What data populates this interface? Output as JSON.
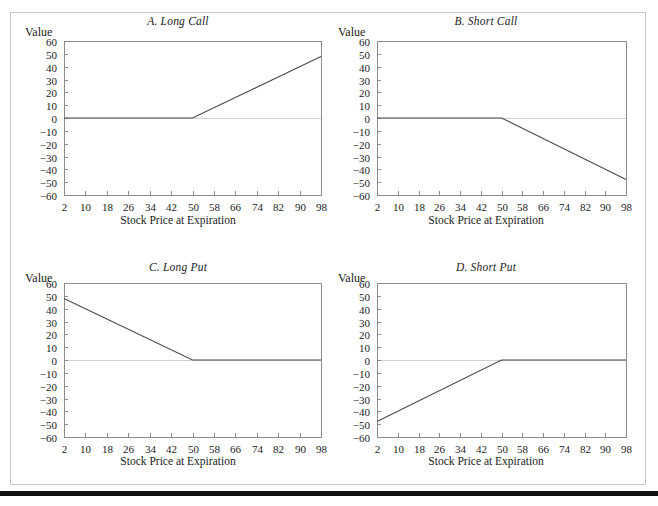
{
  "figure": {
    "value_axis_label": "Value",
    "x_axis_label": "Stock Price at Expiration",
    "frame_color": "#c8c8c8",
    "line_color": "#4a4a4a",
    "rule_color": "#111111"
  },
  "panels": [
    {
      "key": "a",
      "title": "A. Long Call"
    },
    {
      "key": "b",
      "title": "B. Short Call"
    },
    {
      "key": "c",
      "title": "C. Long Put"
    },
    {
      "key": "d",
      "title": "D. Short Put"
    }
  ],
  "chart_data": [
    {
      "type": "line",
      "title": "A. Long Call",
      "xlabel": "Stock Price at Expiration",
      "ylabel": "Value",
      "xlim": [
        2,
        98
      ],
      "ylim": [
        -60,
        60
      ],
      "xticks": [
        2,
        10,
        18,
        26,
        34,
        42,
        50,
        58,
        66,
        74,
        82,
        90,
        98
      ],
      "yticks": [
        60,
        50,
        40,
        30,
        20,
        10,
        0,
        -10,
        -20,
        -30,
        -40,
        -50,
        -60
      ],
      "grid": false,
      "legend": "none",
      "series": [
        {
          "name": "Long Call payoff",
          "x": [
            2,
            50,
            98
          ],
          "values": [
            0,
            0,
            48
          ]
        }
      ],
      "annotations": [
        "strike price = 50",
        "payoff = max(S - 50, 0)"
      ]
    },
    {
      "type": "line",
      "title": "B. Short Call",
      "xlabel": "Stock Price at Expiration",
      "ylabel": "Value",
      "xlim": [
        2,
        98
      ],
      "ylim": [
        -60,
        60
      ],
      "xticks": [
        2,
        10,
        18,
        26,
        34,
        42,
        50,
        58,
        66,
        74,
        82,
        90,
        98
      ],
      "yticks": [
        60,
        50,
        40,
        30,
        20,
        10,
        0,
        -10,
        -20,
        -30,
        -40,
        -50,
        -60
      ],
      "grid": false,
      "legend": "none",
      "series": [
        {
          "name": "Short Call payoff",
          "x": [
            2,
            50,
            98
          ],
          "values": [
            0,
            0,
            -48
          ]
        }
      ],
      "annotations": [
        "strike price = 50",
        "payoff = -max(S - 50, 0)"
      ]
    },
    {
      "type": "line",
      "title": "C. Long Put",
      "xlabel": "Stock Price at Expiration",
      "ylabel": "Value",
      "xlim": [
        2,
        98
      ],
      "ylim": [
        -60,
        60
      ],
      "xticks": [
        2,
        10,
        18,
        26,
        34,
        42,
        50,
        58,
        66,
        74,
        82,
        90,
        98
      ],
      "yticks": [
        60,
        50,
        40,
        30,
        20,
        10,
        0,
        -10,
        -20,
        -30,
        -40,
        -50,
        -60
      ],
      "grid": false,
      "legend": "none",
      "series": [
        {
          "name": "Long Put payoff",
          "x": [
            2,
            50,
            98
          ],
          "values": [
            48,
            0,
            0
          ]
        }
      ],
      "annotations": [
        "strike price = 50",
        "payoff = max(50 - S, 0)"
      ]
    },
    {
      "type": "line",
      "title": "D. Short Put",
      "xlabel": "Stock Price at Expiration",
      "ylabel": "Value",
      "xlim": [
        2,
        98
      ],
      "ylim": [
        -60,
        60
      ],
      "xticks": [
        2,
        10,
        18,
        26,
        34,
        42,
        50,
        58,
        66,
        74,
        82,
        90,
        98
      ],
      "yticks": [
        60,
        50,
        40,
        30,
        20,
        10,
        0,
        -10,
        -20,
        -30,
        -40,
        -50,
        -60
      ],
      "grid": false,
      "legend": "none",
      "series": [
        {
          "name": "Short Put payoff",
          "x": [
            2,
            50,
            98
          ],
          "values": [
            -48,
            0,
            0
          ]
        }
      ],
      "annotations": [
        "strike price = 50",
        "payoff = -max(50 - S, 0)"
      ]
    }
  ]
}
